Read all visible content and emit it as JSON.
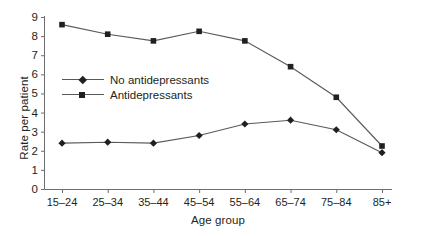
{
  "chart_data": {
    "type": "line",
    "title": "",
    "xlabel": "Age group",
    "ylabel": "Rate per patient",
    "categories": [
      "15–24",
      "25–34",
      "35–44",
      "45–54",
      "55–64",
      "65–74",
      "75–84",
      "85+"
    ],
    "yticks": [
      "0",
      "1",
      "2",
      "3",
      "4",
      "5",
      "6",
      "7",
      "8",
      "9"
    ],
    "ylim": [
      0,
      9
    ],
    "grid": false,
    "legend_position": "inside-upper-left",
    "series": [
      {
        "name": "No antidepressants",
        "marker": "diamond",
        "color": "#231f20",
        "values": [
          2.4,
          2.45,
          2.4,
          2.8,
          3.4,
          3.6,
          3.1,
          1.9
        ]
      },
      {
        "name": "Antidepressants",
        "marker": "square",
        "color": "#231f20",
        "values": [
          8.6,
          8.1,
          7.75,
          8.25,
          7.75,
          6.4,
          4.8,
          2.25
        ]
      }
    ]
  },
  "colors": {
    "line": "#58595b",
    "marker": "#231f20",
    "axis": "#6d6e71",
    "text": "#231f20",
    "background": "#ffffff"
  }
}
